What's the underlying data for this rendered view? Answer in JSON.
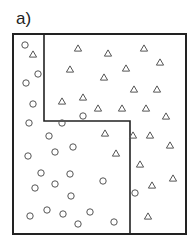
{
  "panel_label": "a)",
  "colors": {
    "border": "#222222",
    "marker": "#555555",
    "background": "#ffffff"
  },
  "outer_box": {
    "x1": 13,
    "y1": 34,
    "x2": 186,
    "y2": 234
  },
  "boundary_path": [
    [
      44,
      34
    ],
    [
      44,
      121
    ],
    [
      130,
      121
    ],
    [
      130,
      234
    ]
  ],
  "marker_size": {
    "circle_r": 3.2,
    "triangle_half_width": 3.6,
    "triangle_height": 6.2
  },
  "circles": [
    [
      25,
      45
    ],
    [
      38,
      74
    ],
    [
      26,
      83
    ],
    [
      33,
      104
    ],
    [
      29,
      123
    ],
    [
      62,
      123
    ],
    [
      83,
      116
    ],
    [
      49,
      136
    ],
    [
      73,
      147
    ],
    [
      55,
      152
    ],
    [
      28,
      156
    ],
    [
      41,
      173
    ],
    [
      70,
      174
    ],
    [
      55,
      184
    ],
    [
      35,
      188
    ],
    [
      103,
      181
    ],
    [
      71,
      196
    ],
    [
      30,
      216
    ],
    [
      47,
      210
    ],
    [
      63,
      214
    ],
    [
      90,
      212
    ],
    [
      78,
      224
    ],
    [
      114,
      222
    ],
    [
      135,
      193
    ]
  ],
  "triangles": [
    [
      33,
      54
    ],
    [
      78,
      48
    ],
    [
      108,
      53
    ],
    [
      144,
      48
    ],
    [
      160,
      62
    ],
    [
      70,
      69
    ],
    [
      126,
      68
    ],
    [
      104,
      77
    ],
    [
      134,
      89
    ],
    [
      157,
      89
    ],
    [
      62,
      101
    ],
    [
      83,
      97
    ],
    [
      98,
      108
    ],
    [
      122,
      108
    ],
    [
      146,
      108
    ],
    [
      166,
      116
    ],
    [
      105,
      133
    ],
    [
      133,
      135
    ],
    [
      150,
      135
    ],
    [
      170,
      145
    ],
    [
      116,
      153
    ],
    [
      140,
      164
    ],
    [
      173,
      178
    ],
    [
      152,
      185
    ],
    [
      148,
      216
    ]
  ]
}
